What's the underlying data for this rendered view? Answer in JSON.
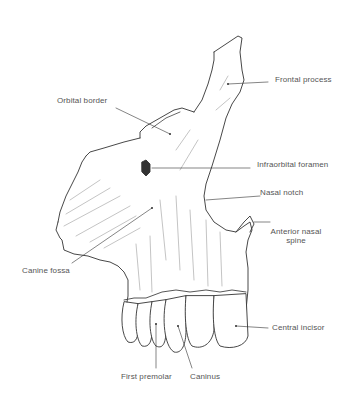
{
  "figure": {
    "labels": {
      "frontal_process": "Frontal process",
      "orbital_border": "Orbital border",
      "infraorbital_foramen": "Infraorbital foramen",
      "nasal_notch": "Nasal notch",
      "anterior_nasal_spine_line1": "Anterior nasal",
      "anterior_nasal_spine_line2": "spine",
      "canine_fossa": "Canine fossa",
      "central_incisor": "Central incisor",
      "first_premolar": "First premolar",
      "caninus": "Caninus"
    }
  }
}
